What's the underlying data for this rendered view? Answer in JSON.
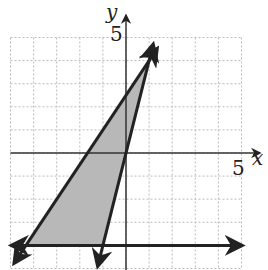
{
  "chart_data": {
    "type": "line",
    "title": "",
    "xlabel": "x",
    "ylabel": "y",
    "xlim": [
      -5,
      5
    ],
    "ylim": [
      -5,
      5
    ],
    "grid": true,
    "grid_step": 1,
    "tick_labels": {
      "x": [
        "5"
      ],
      "y": [
        "5"
      ]
    },
    "series": [
      {
        "name": "line 1",
        "equation": "y = 1.5x + 2.5",
        "points": [
          [
            1,
            4
          ],
          [
            -4.33,
            -4
          ]
        ]
      },
      {
        "name": "line 2",
        "equation": "y = 4x",
        "points": [
          [
            1,
            4
          ],
          [
            -1,
            -4
          ]
        ]
      },
      {
        "name": "line 3",
        "equation": "y = -4",
        "points": [
          [
            -4.33,
            -4
          ],
          [
            5,
            -4
          ]
        ]
      }
    ],
    "shaded_region": {
      "color": "#b8b8b8",
      "vertices": [
        [
          1,
          4
        ],
        [
          -1,
          -4
        ],
        [
          -4.33,
          -4
        ]
      ]
    }
  },
  "labels": {
    "x_axis": "x",
    "y_axis": "y",
    "x_tick": "5",
    "y_tick": "5"
  }
}
